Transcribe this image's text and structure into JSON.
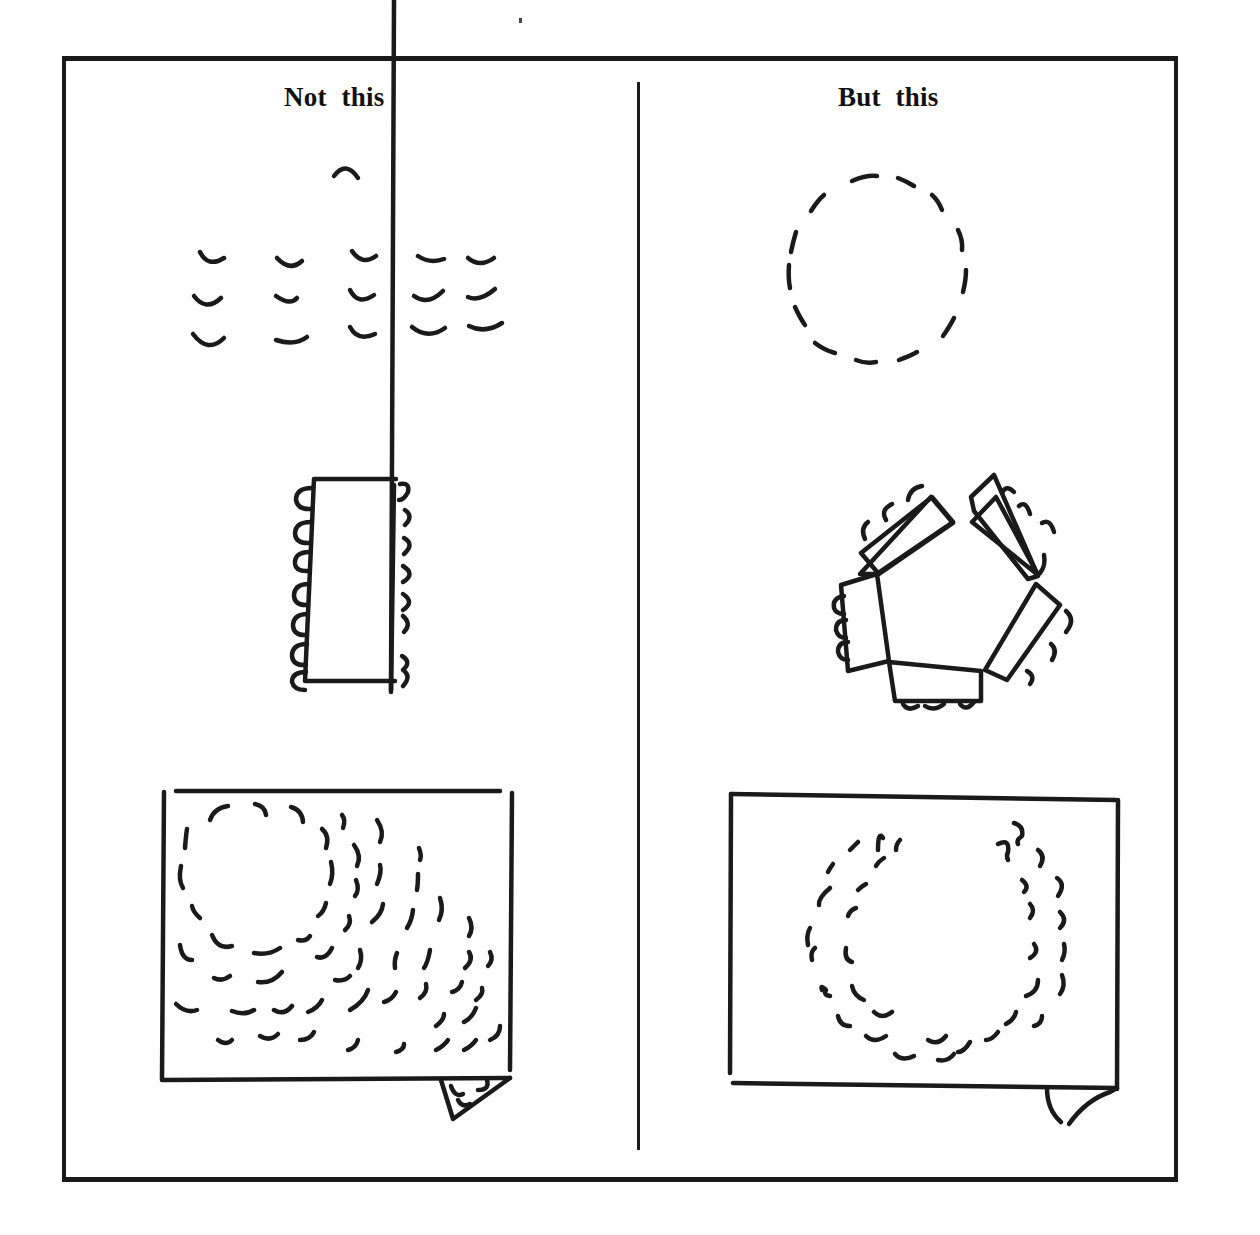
{
  "figure": {
    "left_column": {
      "heading": "Not this",
      "panels": [
        {
          "id": "rows",
          "description": "Participants seated in straight rows facing a single presenter"
        },
        {
          "id": "long-table",
          "description": "Participants seated along both sides of a long rectangular table"
        },
        {
          "id": "flipchart-theatre",
          "description": "Flipchart view: seats crowded in rows/arcs, with a circle at top-left"
        }
      ]
    },
    "right_column": {
      "heading": "But this",
      "panels": [
        {
          "id": "circle",
          "description": "Participants seated in an open circle"
        },
        {
          "id": "pentagon-tables",
          "description": "Five tables arranged in a pentagon with seats around the outside"
        },
        {
          "id": "flipchart-horseshoe",
          "description": "Flipchart view: seats in a double horseshoe / U shape"
        }
      ]
    },
    "colors": {
      "ink": "#1a1a1a",
      "paper": "#ffffff"
    }
  }
}
